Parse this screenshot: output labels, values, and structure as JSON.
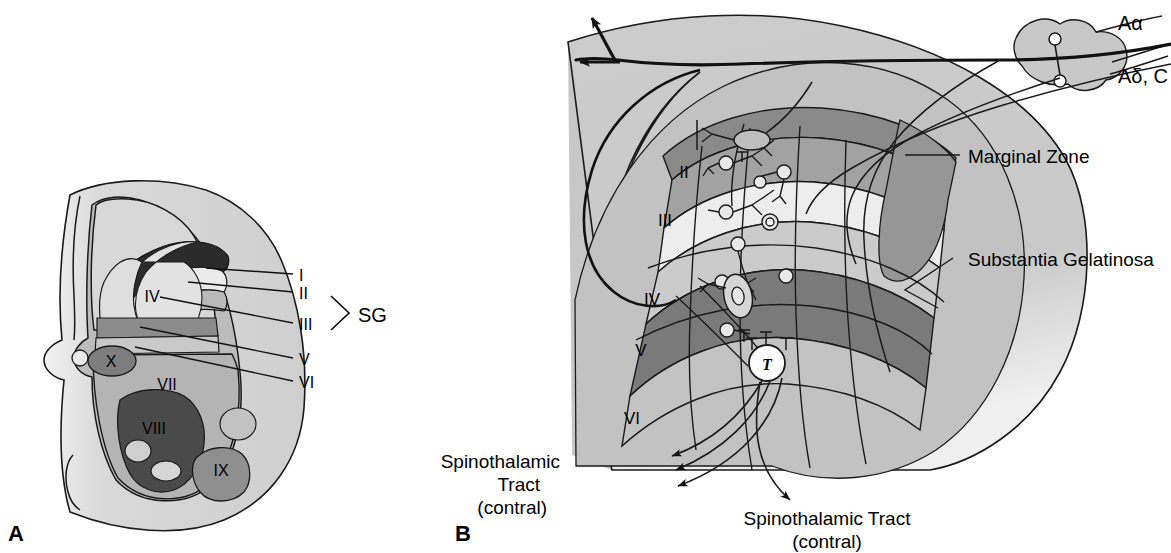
{
  "figure": {
    "background": "#ffffff"
  },
  "panels": [
    {
      "id": "A",
      "letter": "A",
      "caption": "Cross-section of spinal cord gray matter showing Rexed laminae",
      "laminae_labels": [
        {
          "text": "IV",
          "x": 152,
          "y": 302
        },
        {
          "text": "X",
          "x": 111,
          "y": 362
        },
        {
          "text": "VII",
          "x": 167,
          "y": 385
        },
        {
          "text": "VIII",
          "x": 152,
          "y": 429
        },
        {
          "text": "IX",
          "x": 209,
          "y": 470
        }
      ],
      "leader_labels": [
        {
          "text": "I",
          "x": 302,
          "y": 278
        },
        {
          "text": "II",
          "x": 302,
          "y": 297
        },
        {
          "text": "III",
          "x": 302,
          "y": 328
        },
        {
          "text": "V",
          "x": 302,
          "y": 363
        },
        {
          "text": "VI",
          "x": 302,
          "y": 386
        }
      ],
      "bracket_label": {
        "text": "SG",
        "x": 369,
        "y": 318
      }
    },
    {
      "id": "B",
      "letter": "B",
      "caption": "Dorsal horn detail with primary afferents and projection neurons",
      "laminae_labels": [
        {
          "text": "II",
          "x": 684,
          "y": 172
        },
        {
          "text": "III",
          "x": 665,
          "y": 220
        },
        {
          "text": "IV",
          "x": 652,
          "y": 299
        },
        {
          "text": "V",
          "x": 641,
          "y": 350
        },
        {
          "text": "VI",
          "x": 632,
          "y": 418
        }
      ],
      "region_labels": [
        {
          "text": "Marginal Zone",
          "x": 970,
          "y": 160
        },
        {
          "text": "Substantia Gelatinosa",
          "x": 970,
          "y": 260
        }
      ],
      "fiber_labels": [
        {
          "text": "Aα",
          "x": 1118,
          "y": 25
        },
        {
          "text": "Aδ, C",
          "x": 1118,
          "y": 77
        }
      ],
      "tract_labels": [
        {
          "lines": [
            "Spinothalamic",
            "Tract",
            "(contral)"
          ],
          "x": 497,
          "y": 462,
          "align": "middle"
        },
        {
          "lines": [
            "Spinothalamic Tract",
            "(contral)"
          ],
          "x": 827,
          "y": 522,
          "align": "middle"
        }
      ],
      "cell_marker": {
        "text": "T",
        "x": 767,
        "y": 367
      }
    }
  ],
  "colors": {
    "white_matter": "#d0d0d0",
    "gray_matter": "#c6c6c6",
    "lamina_I": "#8a8a8a",
    "lamina_II": "#a2a2a2",
    "lamina_III": "#ededed",
    "lamina_IV": "#cbcbcb",
    "lamina_V": "#7a7a7a",
    "lamina_VI": "#c3c3c3",
    "lamina_VII": "#b4b4b4",
    "lamina_VIII": "#4a4a4a",
    "lamina_IX": "#909090",
    "lamina_X": "#7e7e7e",
    "dark_cap": "#2b2b2b",
    "outline": "#1a1a1a",
    "text": "#000000"
  }
}
